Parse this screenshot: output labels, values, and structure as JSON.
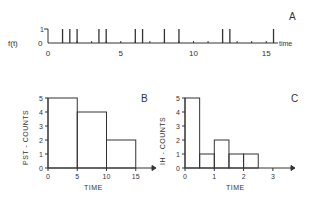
{
  "panel_a": {
    "label": "A",
    "ylabel": "f(t)",
    "yticks": [
      "0",
      "1"
    ],
    "xticks": [
      "0",
      "5",
      "10",
      "15"
    ],
    "xlabel": "time",
    "spike_times": [
      1,
      1.5,
      2,
      3.5,
      4,
      6,
      6.5,
      8,
      9,
      12,
      12.5,
      15.5
    ]
  },
  "chart_data": [
    {
      "type": "bar",
      "title": "B",
      "xlabel": "TIME",
      "ylabel": "PST - COUNTS",
      "bins": [
        [
          0,
          5
        ],
        [
          5,
          10
        ],
        [
          10,
          15
        ]
      ],
      "values": [
        5,
        4,
        2
      ],
      "xticks": [
        "0",
        "5",
        "10",
        "15"
      ],
      "yticks": [
        "0",
        "1",
        "2",
        "3",
        "4",
        "5"
      ],
      "xlim": [
        0,
        18
      ],
      "ylim": [
        0,
        5
      ]
    },
    {
      "type": "bar",
      "title": "C",
      "xlabel": "TIME",
      "ylabel": "IH - COUNTS",
      "bins": [
        [
          0,
          0.5
        ],
        [
          0.5,
          1
        ],
        [
          1,
          1.5
        ],
        [
          1.5,
          2
        ],
        [
          2,
          2.5
        ]
      ],
      "values": [
        5,
        1,
        2,
        1,
        1
      ],
      "xticks": [
        "0",
        "1",
        "2",
        "3"
      ],
      "yticks": [
        "0",
        "1",
        "2",
        "3",
        "4",
        "5"
      ],
      "xlim": [
        0,
        3.6
      ],
      "ylim": [
        0,
        5
      ]
    }
  ]
}
